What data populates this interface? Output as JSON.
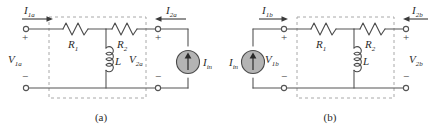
{
  "figure": {
    "type": "circuit-diagram"
  },
  "circuit_a": {
    "caption": "(a)",
    "port1_current": {
      "symbol": "I",
      "subscript": "1a",
      "direction": "right"
    },
    "port2_current": {
      "symbol": "I",
      "subscript": "2a",
      "direction": "left"
    },
    "port1_voltage": {
      "symbol": "V",
      "subscript": "1a"
    },
    "port2_voltage": {
      "symbol": "V",
      "subscript": "2a"
    },
    "plus_sign": "+",
    "minus_sign": "−",
    "components": [
      {
        "name": "resistor-1",
        "symbol": "R",
        "subscript": "1",
        "type": "resistor"
      },
      {
        "name": "resistor-2",
        "symbol": "R",
        "subscript": "2",
        "type": "resistor"
      },
      {
        "name": "inductor",
        "symbol": "L",
        "subscript": "",
        "type": "inductor"
      },
      {
        "name": "current-source",
        "symbol": "I",
        "subscript": "in",
        "type": "current-source",
        "arrow": "up"
      }
    ],
    "source_side": "right",
    "source_color": "#b4b4b4"
  },
  "circuit_b": {
    "caption": "(b)",
    "port1_current": {
      "symbol": "I",
      "subscript": "1b",
      "direction": "right"
    },
    "port2_current": {
      "symbol": "I",
      "subscript": "2b",
      "direction": "left"
    },
    "port1_voltage": {
      "symbol": "V",
      "subscript": "1b"
    },
    "port2_voltage": {
      "symbol": "V",
      "subscript": "2b"
    },
    "plus_sign": "+",
    "minus_sign": "−",
    "components": [
      {
        "name": "resistor-1",
        "symbol": "R",
        "subscript": "1",
        "type": "resistor"
      },
      {
        "name": "resistor-2",
        "symbol": "R",
        "subscript": "2",
        "type": "resistor"
      },
      {
        "name": "inductor",
        "symbol": "L",
        "subscript": "",
        "type": "inductor"
      },
      {
        "name": "current-source",
        "symbol": "I",
        "subscript": "in",
        "type": "current-source",
        "arrow": "up"
      }
    ],
    "source_side": "left",
    "source_color": "#b4b4b4"
  },
  "style": {
    "wire_color": "#555555",
    "component_color": "#4a4a4a",
    "dashed_box_color": "#a8a8a8",
    "text_color": "#2b2b2b",
    "background": "#ffffff"
  }
}
